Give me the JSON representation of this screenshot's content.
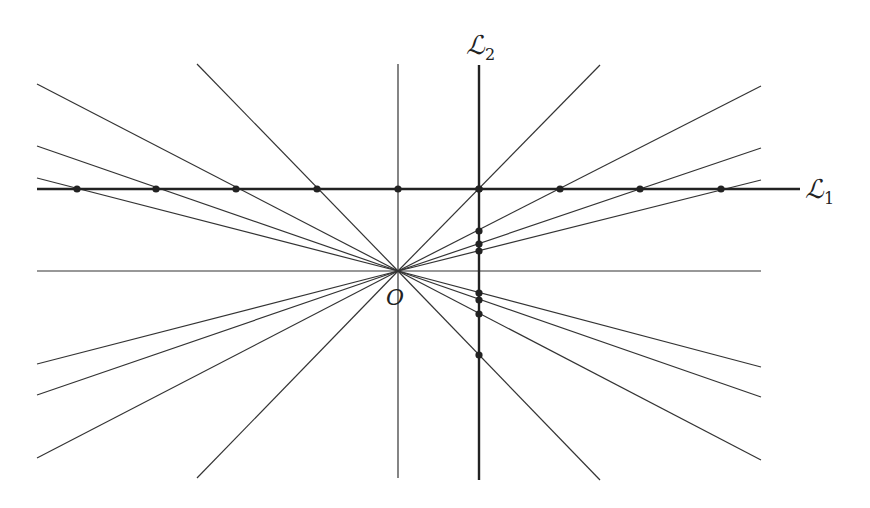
{
  "diagram": {
    "origin": {
      "x": 398,
      "y": 271,
      "label": "O"
    },
    "axes": {
      "horizontal": {
        "x1": 37,
        "x2": 761,
        "y": 271
      },
      "vertical": {
        "x": 398,
        "y1": 64,
        "y2": 478
      }
    },
    "L1": {
      "label": "ℒ",
      "sub": "1",
      "y": 189,
      "x1": 37,
      "x2": 800,
      "points": [
        77,
        156,
        236,
        317,
        398,
        479,
        560,
        640,
        721
      ]
    },
    "L2": {
      "label": "ℒ",
      "sub": "2",
      "x": 479,
      "y1": 65,
      "y2": 480,
      "points": [
        189,
        231,
        244,
        251,
        293,
        300,
        314,
        355
      ]
    },
    "rays": [
      [
        37,
        84
      ],
      [
        37,
        146
      ],
      [
        37,
        178
      ],
      [
        197,
        64
      ],
      [
        600,
        65
      ],
      [
        761,
        86
      ],
      [
        761,
        148
      ],
      [
        761,
        180
      ],
      [
        37,
        364
      ],
      [
        37,
        395
      ],
      [
        37,
        458
      ],
      [
        197,
        478
      ],
      [
        761,
        367
      ],
      [
        761,
        397
      ],
      [
        761,
        460
      ],
      [
        600,
        480
      ]
    ],
    "colors": {
      "line": "#333333",
      "thick": "#222222",
      "dot": "#222222"
    }
  }
}
